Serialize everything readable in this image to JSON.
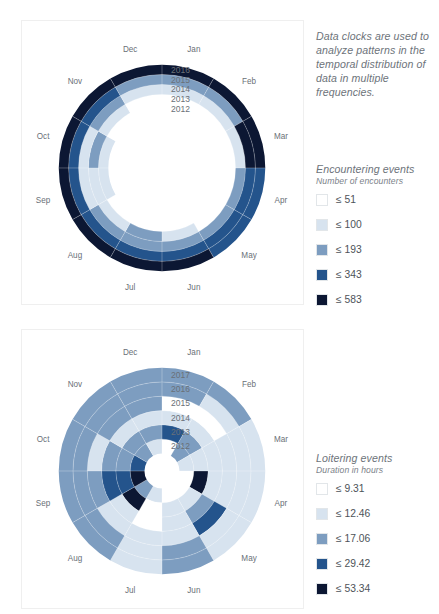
{
  "intro": {
    "text": "Data clocks are used to analyze patterns in the temporal distribution of data in multiple frequencies."
  },
  "months": [
    "Jan",
    "Feb",
    "Mar",
    "Apr",
    "May",
    "Jun",
    "Jul",
    "Aug",
    "Sep",
    "Oct",
    "Nov",
    "Dec"
  ],
  "palette": {
    "c1": "#ffffff",
    "c2": "#d7e3ef",
    "c3": "#7d9dc0",
    "c4": "#24548c",
    "c5": "#0c1733",
    "background": "#ffffff",
    "card_border": "#efefef",
    "text": "#6a7077"
  },
  "legends": [
    {
      "id": "encounters",
      "title": "Encountering events",
      "subtitle": "Number of encounters",
      "items": [
        {
          "label": "≤ 51",
          "color": "#ffffff"
        },
        {
          "label": "≤ 100",
          "color": "#d7e3ef"
        },
        {
          "label": "≤ 193",
          "color": "#7d9dc0"
        },
        {
          "label": "≤ 343",
          "color": "#24548c"
        },
        {
          "label": "≤ 583",
          "color": "#0c1733"
        }
      ]
    },
    {
      "id": "loitering",
      "title": "Loitering events",
      "subtitle": "Duration in hours",
      "items": [
        {
          "label": "≤ 9.31",
          "color": "#ffffff"
        },
        {
          "label": "≤ 12.46",
          "color": "#d7e3ef"
        },
        {
          "label": "≤ 17.06",
          "color": "#7d9dc0"
        },
        {
          "label": "≤ 29.42",
          "color": "#24548c"
        },
        {
          "label": "≤ 53.34",
          "color": "#0c1733"
        }
      ]
    }
  ],
  "chart_data": [
    {
      "id": "encountering-data-clock",
      "type": "heatmap",
      "subtype": "polar-data-clock",
      "title": "Encountering events",
      "value_label": "Number of encounters",
      "angular_categories": [
        "Jan",
        "Feb",
        "Mar",
        "Apr",
        "May",
        "Jun",
        "Jul",
        "Aug",
        "Sep",
        "Oct",
        "Nov",
        "Dec"
      ],
      "radial_categories": [
        "2012",
        "2013",
        "2014",
        "2015",
        "2016"
      ],
      "ring_order": "inner-to-outer",
      "bins": [
        51,
        100,
        193,
        343,
        583
      ],
      "bin_colors": [
        "#ffffff",
        "#d7e3ef",
        "#7d9dc0",
        "#24548c",
        "#0c1733"
      ],
      "inner_hole_fraction": 0.52,
      "legend_position": "right",
      "grid": false,
      "series": [
        {
          "name": "2012",
          "bins": [
            1,
            1,
            1,
            1,
            1,
            1,
            1,
            1,
            2,
            2,
            1,
            1
          ]
        },
        {
          "name": "2013",
          "bins": [
            1,
            1,
            1,
            1,
            1,
            2,
            3,
            2,
            2,
            3,
            2,
            1
          ]
        },
        {
          "name": "2014",
          "bins": [
            2,
            2,
            2,
            3,
            3,
            3,
            3,
            3,
            2,
            2,
            3,
            2
          ]
        },
        {
          "name": "2015",
          "bins": [
            3,
            3,
            5,
            4,
            4,
            4,
            4,
            4,
            4,
            4,
            4,
            3
          ]
        },
        {
          "name": "2016",
          "bins": [
            5,
            5,
            5,
            4,
            4,
            5,
            5,
            5,
            5,
            5,
            5,
            5
          ]
        }
      ]
    },
    {
      "id": "loitering-data-clock",
      "type": "heatmap",
      "subtype": "polar-data-clock",
      "title": "Loitering events",
      "value_label": "Duration in hours",
      "angular_categories": [
        "Jan",
        "Feb",
        "Mar",
        "Apr",
        "May",
        "Jun",
        "Jul",
        "Aug",
        "Sep",
        "Oct",
        "Nov",
        "Dec"
      ],
      "radial_categories": [
        "2012",
        "2013",
        "2014",
        "2015",
        "2016",
        "2017"
      ],
      "ring_order": "inner-to-outer",
      "bins": [
        9.31,
        12.46,
        17.06,
        29.42,
        53.34
      ],
      "bin_colors": [
        "#ffffff",
        "#d7e3ef",
        "#7d9dc0",
        "#24548c",
        "#0c1733"
      ],
      "inner_hole_fraction": 0.17,
      "legend_position": "right",
      "grid": false,
      "series": [
        {
          "name": "2012",
          "bins": [
            1,
            3,
            2,
            1,
            1,
            1,
            2,
            3,
            5,
            4,
            3,
            2
          ]
        },
        {
          "name": "2013",
          "bins": [
            4,
            3,
            2,
            5,
            2,
            2,
            1,
            5,
            4,
            3,
            3,
            3
          ]
        },
        {
          "name": "2014",
          "bins": [
            2,
            2,
            2,
            2,
            3,
            2,
            1,
            2,
            4,
            3,
            2,
            2
          ]
        },
        {
          "name": "2015",
          "bins": [
            1,
            1,
            2,
            2,
            4,
            2,
            2,
            2,
            3,
            2,
            3,
            3
          ]
        },
        {
          "name": "2016",
          "bins": [
            3,
            2,
            2,
            2,
            2,
            3,
            2,
            3,
            3,
            3,
            3,
            3
          ]
        },
        {
          "name": "2017",
          "bins": [
            3,
            3,
            2,
            2,
            2,
            3,
            2,
            3,
            3,
            3,
            3,
            3
          ]
        }
      ]
    }
  ]
}
